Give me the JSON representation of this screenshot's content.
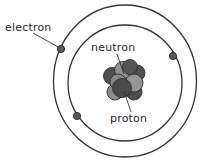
{
  "diagram": {
    "type": "atom-model",
    "labels": {
      "electron": "electron",
      "neutron": "neutron",
      "proton": "proton"
    },
    "orbits": [
      {
        "name": "outer-orbit",
        "cx": 125,
        "cy": 82,
        "rx": 72,
        "ry": 76
      },
      {
        "name": "inner-orbit",
        "cx": 125,
        "cy": 83,
        "rx": 57,
        "ry": 58
      }
    ],
    "electrons": [
      {
        "name": "electron-outer-left",
        "cx": 61,
        "cy": 49
      },
      {
        "name": "electron-outer-right",
        "cx": 173,
        "cy": 56
      },
      {
        "name": "electron-inner-lower-left",
        "cx": 77,
        "cy": 116
      }
    ],
    "colors": {
      "background": "#ffffff",
      "stroke": "#333333",
      "electron": "#555555",
      "proton": "#4d4d4d",
      "neutron": "#8f8f8f"
    }
  }
}
